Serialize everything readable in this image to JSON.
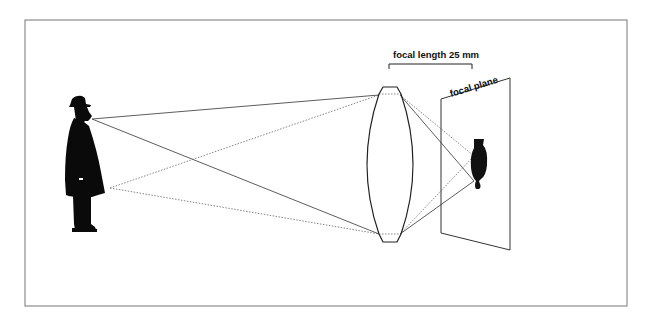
{
  "diagram": {
    "type": "optics-lens-projection",
    "labels": {
      "focal_length": "focal length 25 mm",
      "focal_plane": "focal plane"
    },
    "elements": {
      "subject": "standing man in hat and long coat",
      "lens": "convex lens",
      "image": "inverted image of the man on focal plane"
    },
    "rays": {
      "solid": "from subject's head through lens edges",
      "dotted": "from subject's lower coat through lens edges"
    }
  }
}
